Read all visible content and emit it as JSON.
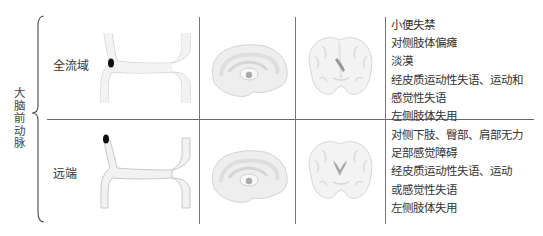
{
  "artery": {
    "label": "大脑前动脉",
    "chars": [
      "大",
      "脑",
      "前",
      "动",
      "脉"
    ]
  },
  "rows": [
    {
      "label": "全流域",
      "occlusion_site": "proximal",
      "symptoms": [
        "小便失禁",
        "对侧肢体偏瘫",
        "淡漠",
        "经皮质运动性失语、运动和",
        "感觉性失语",
        "左侧肢体失用"
      ]
    },
    {
      "label": "远端",
      "occlusion_site": "distal",
      "symptoms": [
        "对侧下肢、臀部、肩部无力",
        "足部感觉障碍",
        "经皮质运动性失语、运动",
        "或感觉性失语",
        "左侧肢体失用"
      ]
    }
  ],
  "columns": [
    "vessel-diagram",
    "sagittal-brain",
    "coronal-brain",
    "symptoms"
  ],
  "colors": {
    "line": "#777777",
    "vessel_fill": "#f2f2f2",
    "vessel_stroke": "#c8c8c8",
    "occlusion": "#111111",
    "brain_fill": "#eeeeee",
    "brain_stroke": "#d4d4d4"
  }
}
